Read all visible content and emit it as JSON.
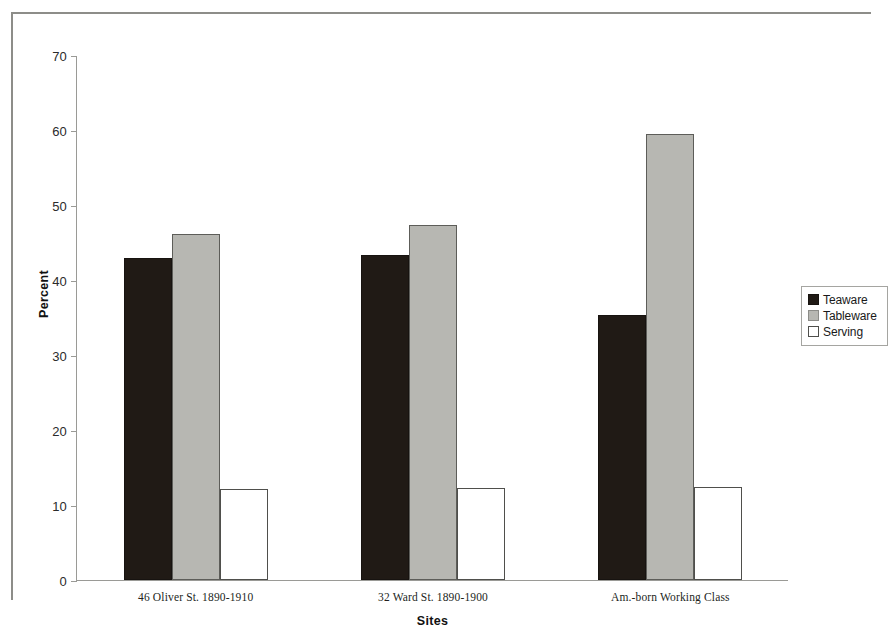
{
  "chart_data": {
    "type": "bar",
    "title": "",
    "xlabel": "Sites",
    "ylabel": "Percent",
    "ylim": [
      0,
      70
    ],
    "yticks": [
      0,
      10,
      20,
      30,
      40,
      50,
      60,
      70
    ],
    "grid": false,
    "legend_position": "right",
    "categories": [
      "46 Oliver St. 1890-1910",
      "32 Ward St. 1890-1900",
      "Am.-born Working Class"
    ],
    "series": [
      {
        "name": "Teaware",
        "color": "#201a15",
        "values": [
          43.0,
          43.3,
          35.4
        ]
      },
      {
        "name": "Tableware",
        "color": "#b7b7b2",
        "values": [
          46.1,
          47.3,
          59.5
        ]
      },
      {
        "name": "Serving",
        "color": "#ffffff",
        "values": [
          12.1,
          12.3,
          12.4
        ]
      }
    ]
  }
}
